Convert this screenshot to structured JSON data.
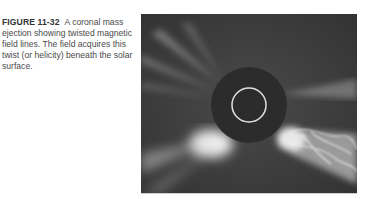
{
  "caption": {
    "label": "FIGURE 11-32",
    "text": "A coronal mass ejection showing twisted magnetic field lines. The field acquires this twist (or helicity) beneath the solar surface."
  },
  "figure": {
    "background_color": "#3a3a3a",
    "occulter_color": "#2a2a2a",
    "sun_outline_color": "#e0e0e0"
  }
}
